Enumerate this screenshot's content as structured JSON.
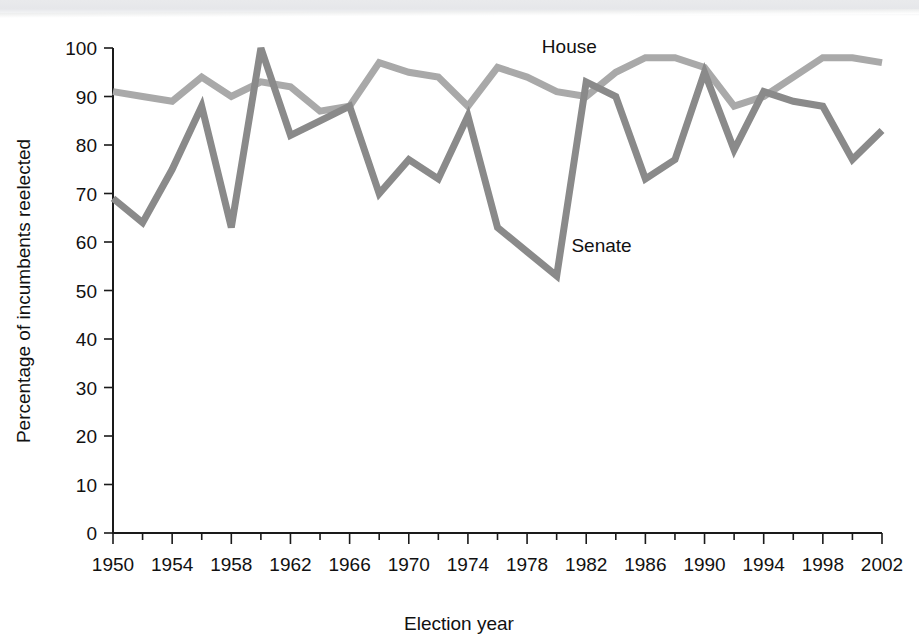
{
  "figure": {
    "background_color": "#ffffff",
    "scan_band_color": "#e7e8ea"
  },
  "chart_data": {
    "type": "line",
    "title": "",
    "xlabel": "Election year",
    "ylabel": "Percentage of incumbents reelected",
    "xlim": [
      1950,
      2002
    ],
    "ylim": [
      0,
      100
    ],
    "grid": false,
    "legend": "inline-labels",
    "x_tick_labels": [
      "1950",
      "1954",
      "1958",
      "1962",
      "1966",
      "1970",
      "1974",
      "1978",
      "1982",
      "1986",
      "1990",
      "1994",
      "1998",
      "2002"
    ],
    "x_tick_values": [
      1950,
      1954,
      1958,
      1962,
      1966,
      1970,
      1974,
      1978,
      1982,
      1986,
      1990,
      1994,
      1998,
      2002
    ],
    "x_minor_tick_values": [
      1952,
      1956,
      1960,
      1964,
      1968,
      1972,
      1976,
      1980,
      1984,
      1988,
      1992,
      1996,
      2000
    ],
    "y_tick_labels": [
      "0",
      "10",
      "20",
      "30",
      "40",
      "50",
      "60",
      "70",
      "80",
      "90",
      "100"
    ],
    "y_tick_values": [
      0,
      10,
      20,
      30,
      40,
      50,
      60,
      70,
      80,
      90,
      100
    ],
    "x": [
      1950,
      1952,
      1954,
      1956,
      1958,
      1960,
      1962,
      1964,
      1966,
      1968,
      1970,
      1972,
      1974,
      1976,
      1978,
      1980,
      1982,
      1984,
      1986,
      1988,
      1990,
      1992,
      1994,
      1996,
      1998,
      2000,
      2002
    ],
    "series": [
      {
        "name": "House",
        "color": "#a9a9a9",
        "label": "House",
        "label_x": 1979,
        "label_y": 99,
        "values": [
          91,
          90,
          89,
          94,
          90,
          93,
          92,
          87,
          88,
          97,
          95,
          94,
          88,
          96,
          94,
          91,
          90,
          95,
          98,
          98,
          96,
          88,
          90,
          94,
          98,
          98,
          97
        ]
      },
      {
        "name": "Senate",
        "color": "#8a8a8a",
        "label": "Senate",
        "label_x": 1981,
        "label_y": 58,
        "values": [
          69,
          64,
          75,
          88,
          63,
          100,
          82,
          85,
          88,
          70,
          77,
          73,
          86,
          63,
          58,
          53,
          93,
          90,
          73,
          77,
          95,
          79,
          91,
          89,
          88,
          77,
          83
        ]
      }
    ]
  },
  "axis": {
    "y_axis_title": "Percentage of incumbents reelected",
    "x_axis_title": "Election year"
  }
}
